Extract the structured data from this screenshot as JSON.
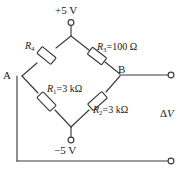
{
  "figure": {
    "type": "circuit-diagram",
    "name": "wheatstone-bridge",
    "line_color": "#3b3b3b",
    "text_color": "#1a1a1a",
    "background": "#ffffff"
  },
  "supplies": {
    "positive": "+5 V",
    "negative": "−5 V"
  },
  "nodes": {
    "a": "A",
    "b": "B"
  },
  "resistors": {
    "top_left": {
      "symbol": "R",
      "subscript": "4",
      "label_value": ""
    },
    "top_right": {
      "symbol": "R",
      "subscript": "3",
      "label_value": "=100 Ω"
    },
    "bottom_left": {
      "symbol": "R",
      "subscript": "1",
      "label_value": "=3 kΩ"
    },
    "bottom_right": {
      "symbol": "R",
      "subscript": "2",
      "label_value": "=3 kΩ"
    }
  },
  "output": {
    "delta_v_symbol": "Δ",
    "delta_v_variable": "V"
  }
}
